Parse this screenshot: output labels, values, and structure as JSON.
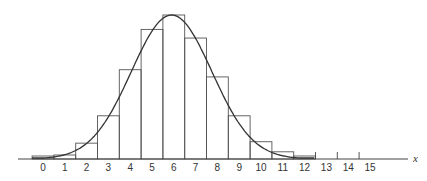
{
  "chart_data": {
    "type": "bar",
    "title": "",
    "xlabel": "x",
    "ylabel": "",
    "grid": false,
    "legend": null,
    "categories": [
      "0",
      "1",
      "2",
      "3",
      "4",
      "5",
      "6",
      "7",
      "8",
      "9",
      "10",
      "11",
      "12"
    ],
    "x_ticks": [
      "0",
      "1",
      "2",
      "3",
      "4",
      "5",
      "6",
      "7",
      "8",
      "9",
      "10",
      "11",
      "12",
      "13",
      "14",
      "15"
    ],
    "series": [
      {
        "name": "histogram (binomial probabilities)",
        "values": [
          0.003,
          0.004,
          0.11,
          0.3,
          0.62,
          0.9,
          1.0,
          0.84,
          0.57,
          0.3,
          0.12,
          0.05,
          0.02
        ]
      },
      {
        "name": "normal approximation curve",
        "type": "line",
        "mean": 5.9,
        "peak": 1.0
      }
    ],
    "ylim": [
      0,
      1.05
    ],
    "xlim": [
      -0.5,
      16
    ]
  }
}
